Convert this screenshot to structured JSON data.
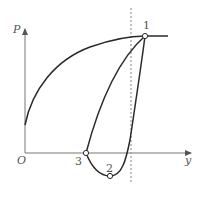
{
  "diagram": {
    "axes": {
      "y_axis_label": "P",
      "x_axis_label": "y",
      "origin_label": "O"
    },
    "points": [
      {
        "id": "point-1",
        "label": "1"
      },
      {
        "id": "point-2",
        "label": "2"
      },
      {
        "id": "point-3",
        "label": "3"
      }
    ],
    "colors": {
      "curve": "#2a2a2a",
      "axis": "#666666",
      "dashed_line": "#999999",
      "text": "#555555"
    }
  }
}
